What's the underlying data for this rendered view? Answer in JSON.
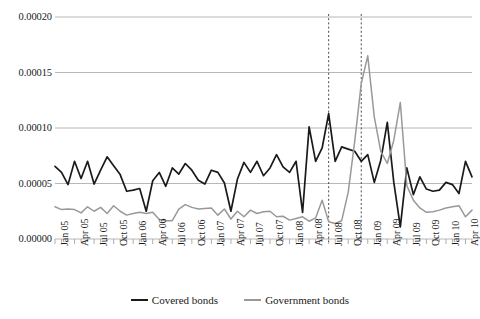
{
  "chart_data": {
    "type": "line",
    "title": "",
    "xlabel": "",
    "ylabel": "",
    "ylim": [
      0.0,
      0.0002
    ],
    "yticks": [
      "0.00000",
      "0.00005",
      "0.00010",
      "0.00015",
      "0.00020"
    ],
    "ytick_values": [
      0.0,
      5e-05,
      0.0001,
      0.00015,
      0.0002
    ],
    "grid": "horizontal",
    "legend_position": "bottom",
    "xtick_labels": [
      "Jan 05",
      "Apr 05",
      "Jul 05",
      "Oct 05",
      "Jan 06",
      "Apr 06",
      "Jul 06",
      "Oct 06",
      "Jan 07",
      "Apr 07",
      "Jul 07",
      "Oct 07",
      "Jan 08",
      "Apr 08",
      "Jul 08",
      "Oct 08",
      "Jan 09",
      "Apr 09",
      "Jul 09",
      "Oct 09",
      "Jan 10",
      "Apr 10"
    ],
    "x_months": [
      "Jan 05",
      "Feb 05",
      "Mar 05",
      "Apr 05",
      "May 05",
      "Jun 05",
      "Jul 05",
      "Aug 05",
      "Sep 05",
      "Oct 05",
      "Nov 05",
      "Dec 05",
      "Jan 06",
      "Feb 06",
      "Mar 06",
      "Apr 06",
      "May 06",
      "Jun 06",
      "Jul 06",
      "Aug 06",
      "Sep 06",
      "Oct 06",
      "Nov 06",
      "Dec 06",
      "Jan 07",
      "Feb 07",
      "Mar 07",
      "Apr 07",
      "May 07",
      "Jun 07",
      "Jul 07",
      "Aug 07",
      "Sep 07",
      "Oct 07",
      "Nov 07",
      "Dec 07",
      "Jan 08",
      "Feb 08",
      "Mar 08",
      "Apr 08",
      "May 08",
      "Jun 08",
      "Jul 08",
      "Aug 08",
      "Sep 08",
      "Oct 08",
      "Nov 08",
      "Dec 08",
      "Jan 09",
      "Feb 09",
      "Mar 09",
      "Apr 09",
      "May 09",
      "Jun 09",
      "Jul 09",
      "Aug 09",
      "Sep 09",
      "Oct 09",
      "Nov 09",
      "Dec 09",
      "Jan 10",
      "Feb 10",
      "Mar 10",
      "Apr 10",
      "May 10"
    ],
    "series": [
      {
        "name": "Covered bonds",
        "color": "#1a1a1a",
        "values": [
          6.55e-05,
          6e-05,
          4.9e-05,
          7e-05,
          5.45e-05,
          7e-05,
          4.95e-05,
          6.2e-05,
          7.4e-05,
          6.6e-05,
          5.8e-05,
          4.3e-05,
          4.4e-05,
          4.55e-05,
          2.5e-05,
          5.25e-05,
          6e-05,
          4.75e-05,
          6.4e-05,
          5.85e-05,
          6.8e-05,
          6.2e-05,
          5.3e-05,
          4.95e-05,
          6.2e-05,
          6e-05,
          5.05e-05,
          2.5e-05,
          5.4e-05,
          6.9e-05,
          6e-05,
          7e-05,
          5.7e-05,
          6.4e-05,
          7.6e-05,
          6.5e-05,
          6e-05,
          7e-05,
          2.4e-05,
          0.000101,
          7e-05,
          8.2e-05,
          0.000113,
          7e-05,
          8.3e-05,
          8.1e-05,
          7.9e-05,
          7e-05,
          7.6e-05,
          5.1e-05,
          7.1e-05,
          0.000105,
          5.1e-05,
          1.1e-05,
          6.4e-05,
          4e-05,
          5.6e-05,
          4.5e-05,
          4.3e-05,
          4.4e-05,
          5.1e-05,
          4.9e-05,
          4.1e-05,
          7e-05,
          5.6e-05
        ],
        "peak": 0.000113,
        "min": 1.1e-05
      },
      {
        "name": "Government bonds",
        "color": "#999999",
        "values": [
          2.9e-05,
          2.65e-05,
          2.7e-05,
          2.65e-05,
          2.35e-05,
          2.9e-05,
          2.5e-05,
          2.85e-05,
          2.3e-05,
          3e-05,
          2.5e-05,
          2.15e-05,
          2.3e-05,
          2.4e-05,
          2.3e-05,
          2.4e-05,
          1.75e-05,
          1.65e-05,
          1.65e-05,
          2.7e-05,
          3.1e-05,
          2.85e-05,
          2.7e-05,
          2.75e-05,
          2.8e-05,
          2.15e-05,
          2.7e-05,
          1.8e-05,
          2.5e-05,
          2e-05,
          2.6e-05,
          2.3e-05,
          2.45e-05,
          2.5e-05,
          2e-05,
          2.05e-05,
          1.7e-05,
          1.85e-05,
          2e-05,
          1.6e-05,
          1.9e-05,
          3.5e-05,
          1.55e-05,
          1.4e-05,
          1.65e-05,
          4.2e-05,
          8.8e-05,
          0.00014,
          0.000165,
          0.00011,
          7.9e-05,
          6.8e-05,
          8.9e-05,
          0.000123,
          4.8e-05,
          3.5e-05,
          2.8e-05,
          2.4e-05,
          2.45e-05,
          2.6e-05,
          2.8e-05,
          2.9e-05,
          3e-05,
          2e-05,
          2.6e-05
        ],
        "peak": 0.000165,
        "min": 1.4e-05
      }
    ],
    "annotations": [
      {
        "type": "vertical-dashed-line",
        "label": "marker-1",
        "x_month": "Jul 08",
        "color": "#4d4d4d"
      },
      {
        "type": "vertical-dashed-line",
        "label": "marker-2",
        "x_month": "Dec 08",
        "color": "#4d4d4d"
      }
    ]
  },
  "legend": {
    "entries": [
      {
        "label": "Covered bonds",
        "color": "#1a1a1a"
      },
      {
        "label": "Government bonds",
        "color": "#999999"
      }
    ]
  }
}
